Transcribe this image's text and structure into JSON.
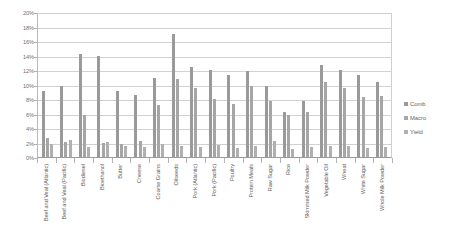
{
  "chart_data": {
    "type": "bar",
    "title": "",
    "subtitle": "",
    "xlabel": "",
    "ylabel": "",
    "ylim": [
      0,
      20
    ],
    "y_tick_labels": [
      "0%",
      "2%",
      "4%",
      "6%",
      "8%",
      "10%",
      "12%",
      "14%",
      "16%",
      "18%",
      "20%"
    ],
    "y_tick_values": [
      0,
      2,
      4,
      6,
      8,
      10,
      12,
      14,
      16,
      18,
      20
    ],
    "grid": true,
    "legend_position": "right",
    "value_unit": "%",
    "categories": [
      "Beef and Veal (Atlantic)",
      "Beef and Veal (Pacific)",
      "Biodiesel",
      "Bioethanol",
      "Butter",
      "Cheese",
      "Coarse Grains",
      "Oilseeds",
      "Pork (Atlantic)",
      "Pork (Pacific)",
      "Poultry",
      "Protein Meals",
      "Raw Sugar",
      "Rice",
      "Skimmed Milk Powder",
      "Vegetable Oil",
      "Wheat",
      "White Sugar",
      "Whole Milk Powder"
    ],
    "series": [
      {
        "name": "Comb",
        "color": "#9a9a9a",
        "values": [
          9.3,
          10.0,
          14.4,
          14.1,
          9.3,
          8.7,
          11.0,
          17.1,
          12.5,
          12.2,
          11.5,
          12.0,
          10.0,
          6.3,
          7.9,
          12.8,
          12.2,
          11.4,
          10.5
        ]
      },
      {
        "name": "Macro",
        "color": "#a6a6a6",
        "values": [
          2.7,
          2.2,
          6.0,
          2.1,
          2.0,
          2.4,
          7.3,
          10.9,
          9.6,
          8.2,
          7.5,
          10.0,
          7.9,
          5.9,
          6.4,
          10.5,
          9.6,
          8.4,
          8.6
        ]
      },
      {
        "name": "Yield",
        "color": "#b0b0b0",
        "values": [
          1.9,
          2.5,
          1.5,
          2.2,
          1.6,
          1.5,
          1.9,
          1.7,
          1.5,
          1.8,
          1.4,
          1.6,
          2.4,
          1.3,
          1.5,
          1.7,
          1.6,
          1.4,
          1.5
        ]
      }
    ]
  },
  "legend": {
    "items": [
      {
        "label": "Comb"
      },
      {
        "label": "Macro"
      },
      {
        "label": "Yield"
      }
    ]
  }
}
